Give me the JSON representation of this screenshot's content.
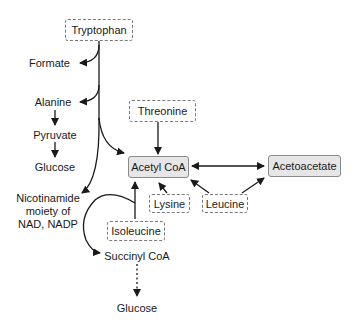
{
  "diagram": {
    "type": "metabolic-pathway",
    "source_amino_acids": {
      "tryptophan": "Tryptophan",
      "threonine": "Threonine",
      "lysine": "Lysine",
      "leucine": "Leucine",
      "isoleucine": "Isoleucine"
    },
    "key_metabolites": {
      "acetyl_coa": "Acetyl CoA",
      "acetoacetate": "Acetoacetate"
    },
    "products": {
      "formate": "Formate",
      "alanine": "Alanine",
      "pyruvate": "Pyruvate",
      "glucose_1": "Glucose",
      "nicotinamide_line1": "Nicotinamide",
      "nicotinamide_line2": "moiety of",
      "nicotinamide_line3": "NAD, NADP",
      "succinyl_coa": "Succinyl CoA",
      "glucose_2": "Glucose"
    },
    "edges": [
      {
        "from": "Tryptophan",
        "to": "Formate"
      },
      {
        "from": "Tryptophan",
        "to": "Alanine"
      },
      {
        "from": "Alanine",
        "to": "Pyruvate"
      },
      {
        "from": "Pyruvate",
        "to": "Glucose"
      },
      {
        "from": "Tryptophan",
        "to": "Acetyl CoA"
      },
      {
        "from": "Tryptophan",
        "to": "Nicotinamide moiety of NAD, NADP"
      },
      {
        "from": "Threonine",
        "to": "Acetyl CoA"
      },
      {
        "from": "Acetyl CoA",
        "to": "Acetoacetate",
        "bidirectional": true
      },
      {
        "from": "Lysine",
        "to": "Acetyl CoA"
      },
      {
        "from": "Leucine",
        "to": "Acetyl CoA"
      },
      {
        "from": "Leucine",
        "to": "Acetoacetate"
      },
      {
        "from": "Isoleucine",
        "to": "Acetyl CoA"
      },
      {
        "from": "Isoleucine",
        "to": "Succinyl CoA"
      },
      {
        "from": "Succinyl CoA",
        "to": "Glucose",
        "style": "dashed"
      }
    ],
    "colors": {
      "line": "#1a1a1a",
      "dashed_border": "#7a7a7a",
      "solid_box_fill": "#e6e6e6",
      "solid_box_border": "#8a8a8a"
    }
  }
}
